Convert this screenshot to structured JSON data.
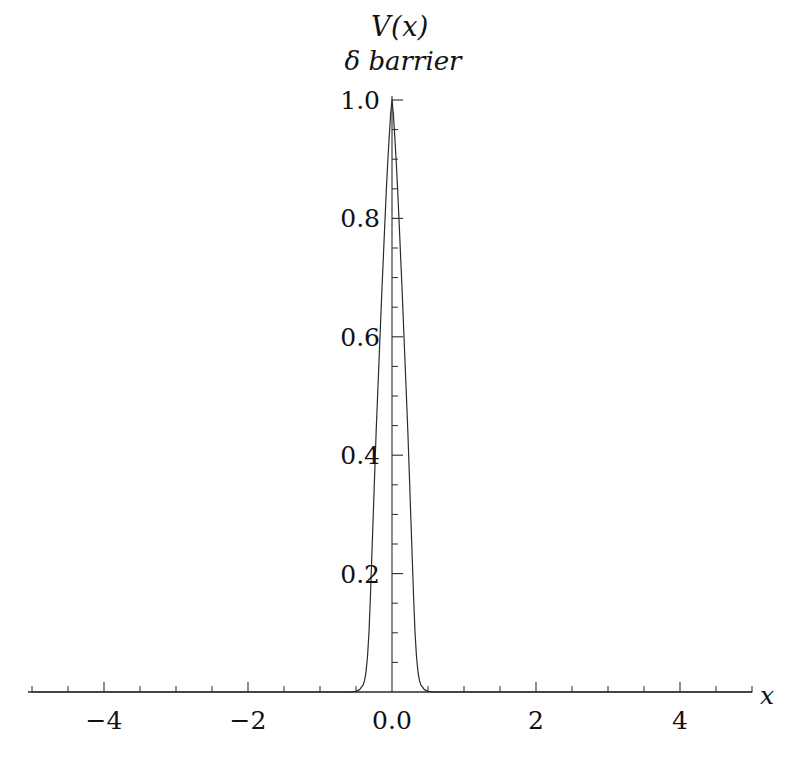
{
  "figure": {
    "title_line1": "V(x)",
    "title_line2": "δ  barrier",
    "background_color": "#ffffff",
    "line_color": "#2b2b2b"
  },
  "axes": {
    "x_axis_label": "x",
    "y_axis_label": ""
  },
  "chart_data": {
    "type": "line",
    "title": "V(x)  δ barrier",
    "subtitle": "δ  barrier",
    "xlabel": "x",
    "ylabel": "V(x)",
    "xlim": [
      -5.05,
      5.0
    ],
    "ylim": [
      0.0,
      1.0
    ],
    "grid": false,
    "legend": null,
    "x_major_ticks": [
      -4,
      -2,
      0,
      2,
      4
    ],
    "x_major_tick_labels": [
      "-4",
      "-2",
      "0.0",
      "2",
      "4"
    ],
    "x_minor_tick_step": 0.5,
    "y_major_ticks": [
      0.2,
      0.4,
      0.6,
      0.8,
      1.0
    ],
    "y_major_tick_labels": [
      "0.2",
      "0.4",
      "0.6",
      "0.8",
      "1.0"
    ],
    "y_minor_tick_step": 0.05,
    "series": [
      {
        "name": "delta barrier potential",
        "style": "solid",
        "x": [
          -5.0,
          -4.5,
          -4.0,
          -3.5,
          -3.0,
          -2.5,
          -2.0,
          -1.5,
          -1.0,
          -0.8,
          -0.6,
          -0.5,
          -0.45,
          -0.4,
          -0.38,
          -0.36,
          -0.34,
          -0.32,
          -0.3,
          -0.28,
          -0.26,
          -0.24,
          -0.22,
          -0.2,
          -0.18,
          -0.16,
          -0.14,
          -0.12,
          -0.1,
          -0.08,
          -0.06,
          -0.04,
          -0.02,
          0.0,
          0.02,
          0.04,
          0.06,
          0.08,
          0.1,
          0.12,
          0.14,
          0.16,
          0.18,
          0.2,
          0.22,
          0.24,
          0.26,
          0.28,
          0.3,
          0.32,
          0.34,
          0.36,
          0.38,
          0.4,
          0.45,
          0.5,
          0.6,
          0.8,
          1.0,
          1.5,
          2.0,
          2.5,
          3.0,
          3.5,
          4.0,
          4.5,
          5.0
        ],
        "y": [
          0.0,
          0.0,
          0.0,
          0.0,
          0.0,
          0.0,
          0.0,
          0.0,
          0.0,
          0.0,
          0.0,
          0.001,
          0.004,
          0.012,
          0.02,
          0.035,
          0.06,
          0.1,
          0.16,
          0.23,
          0.3,
          0.37,
          0.44,
          0.5,
          0.56,
          0.62,
          0.68,
          0.735,
          0.79,
          0.845,
          0.893,
          0.935,
          0.975,
          1.0,
          0.975,
          0.935,
          0.893,
          0.845,
          0.79,
          0.735,
          0.68,
          0.62,
          0.56,
          0.5,
          0.44,
          0.37,
          0.3,
          0.23,
          0.16,
          0.1,
          0.06,
          0.035,
          0.02,
          0.012,
          0.004,
          0.001,
          0.0,
          0.0,
          0.0,
          0.0,
          0.0,
          0.0,
          0.0,
          0.0,
          0.0,
          0.0,
          0.0
        ]
      }
    ]
  }
}
